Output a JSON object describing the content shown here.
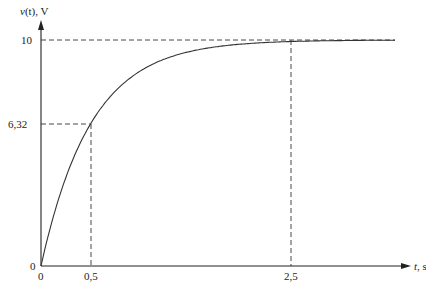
{
  "chart_data": {
    "type": "line",
    "title": "",
    "xlabel": "t, s",
    "ylabel": "v(t), V",
    "xlabel_var": "t",
    "xlabel_unit": ", s",
    "ylabel_var": "v",
    "ylabel_arg": "(t)",
    "ylabel_unit": ", V",
    "function": "v(t) = 10(1 - e^(-t/0.5))",
    "tau": 0.5,
    "final_value": 10,
    "x_range": [
      0,
      3.54
    ],
    "ylim": [
      0,
      10
    ],
    "x_ticks": [
      "0",
      "0,5",
      "2,5"
    ],
    "y_ticks": [
      "0",
      "6,32",
      "10"
    ],
    "series": [
      {
        "name": "v(t)",
        "x": [
          0,
          0.1,
          0.25,
          0.5,
          0.75,
          1.0,
          1.5,
          2.0,
          2.5,
          3.0,
          3.5
        ],
        "values": [
          0,
          1.81,
          3.93,
          6.32,
          7.77,
          8.65,
          9.5,
          9.82,
          9.93,
          9.98,
          9.99
        ]
      }
    ],
    "annotations": [
      {
        "type": "dashed-guide",
        "from": [
          0,
          6.32
        ],
        "to": [
          0.5,
          6.32
        ],
        "label": "6,32"
      },
      {
        "type": "dashed-guide",
        "from": [
          0.5,
          0
        ],
        "to": [
          0.5,
          6.32
        ],
        "label": "0,5"
      },
      {
        "type": "dashed-guide",
        "from": [
          0,
          10
        ],
        "to": [
          3.54,
          10
        ],
        "label": "10"
      },
      {
        "type": "dashed-guide",
        "from": [
          2.5,
          0
        ],
        "to": [
          2.5,
          10
        ],
        "label": "2,5"
      }
    ],
    "grid": false,
    "legend": null
  },
  "labels": {
    "origin_y": "0",
    "origin_x": "0",
    "y_mid": "6,32",
    "y_top": "10",
    "x_tau": "0,5",
    "x_5tau": "2,5"
  }
}
